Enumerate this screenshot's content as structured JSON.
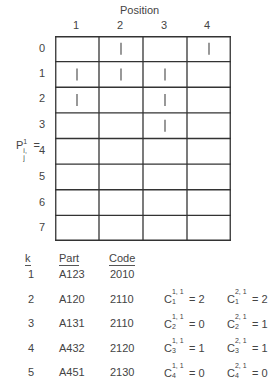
{
  "figure": {
    "title": "Position",
    "columns": [
      "1",
      "2",
      "3",
      "4"
    ],
    "rows": [
      "0",
      "1",
      "2",
      "3",
      "4",
      "5",
      "6",
      "7"
    ],
    "matrix_label": {
      "base": "P",
      "superscript": "1",
      "subscript": "i, j",
      "suffix": "="
    },
    "marks": [
      {
        "row": 0,
        "col": 1
      },
      {
        "row": 0,
        "col": 3
      },
      {
        "row": 1,
        "col": 0
      },
      {
        "row": 1,
        "col": 1
      },
      {
        "row": 1,
        "col": 2
      },
      {
        "row": 2,
        "col": 0
      },
      {
        "row": 2,
        "col": 2
      },
      {
        "row": 3,
        "col": 2
      }
    ],
    "mark_symbol": "|"
  },
  "table": {
    "headers": [
      "k",
      "Part",
      "Code"
    ],
    "rows": [
      {
        "k": "1",
        "part": "A123",
        "code": "2010"
      },
      {
        "k": "2",
        "part": "A120",
        "code": "2110"
      },
      {
        "k": "3",
        "part": "A131",
        "code": "2110"
      },
      {
        "k": "4",
        "part": "A432",
        "code": "2120"
      },
      {
        "k": "5",
        "part": "A451",
        "code": "2130"
      },
      {
        "k": "6",
        "part": "A112",
        "code": "1110"
      }
    ]
  },
  "counts": {
    "column1": [
      {
        "base": "C",
        "sup": "1, 1",
        "sub": "1",
        "value": "= 2"
      },
      {
        "base": "C",
        "sup": "1, 1",
        "sub": "2",
        "value": "= 0"
      },
      {
        "base": "C",
        "sup": "1, 1",
        "sub": "3",
        "value": "= 1"
      },
      {
        "base": "C",
        "sup": "1, 1",
        "sub": "4",
        "value": "= 0"
      }
    ],
    "column2": [
      {
        "base": "C",
        "sup": "2, 1",
        "sub": "1",
        "value": "= 2"
      },
      {
        "base": "C",
        "sup": "2, 1",
        "sub": "2",
        "value": "= 1"
      },
      {
        "base": "C",
        "sup": "2, 1",
        "sub": "3",
        "value": "= 1"
      },
      {
        "base": "C",
        "sup": "2, 1",
        "sub": "4",
        "value": "= 0"
      }
    ]
  }
}
